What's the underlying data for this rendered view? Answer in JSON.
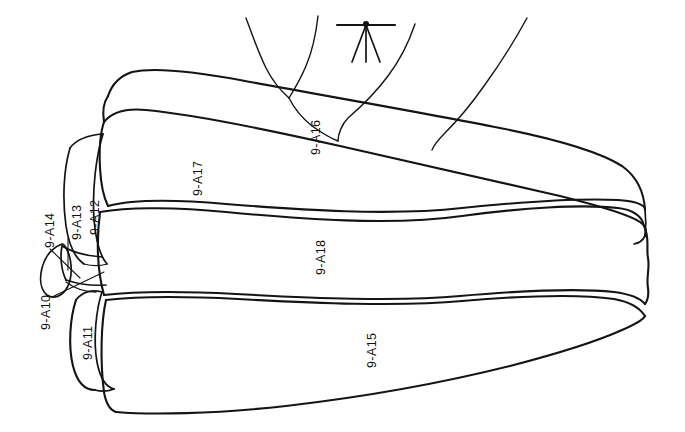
{
  "figure": {
    "background_color": "#ffffff",
    "line_color": "#141414",
    "canvas": {
      "width": 685,
      "height": 432
    }
  },
  "labels": [
    {
      "id": "9-A10",
      "text": "9-A10",
      "x": 40,
      "y": 330,
      "has_leader": true
    },
    {
      "id": "9-A11",
      "text": "9-A11",
      "x": 82,
      "y": 360,
      "has_leader": false
    },
    {
      "id": "9-A12",
      "text": "9-A12",
      "x": 89,
      "y": 235,
      "has_leader": false
    },
    {
      "id": "9-A13",
      "text": "9-A13",
      "x": 71,
      "y": 240,
      "has_leader": true
    },
    {
      "id": "9-A14",
      "text": "9-A14",
      "x": 44,
      "y": 248,
      "has_leader": true
    },
    {
      "id": "9-A15",
      "text": "9-A15",
      "x": 366,
      "y": 368,
      "has_leader": false
    },
    {
      "id": "9-A16",
      "text": "9-A16",
      "x": 310,
      "y": 155,
      "has_leader": false
    },
    {
      "id": "9-A17",
      "text": "9-A17",
      "x": 192,
      "y": 196,
      "has_leader": false
    },
    {
      "id": "9-A18",
      "text": "9-A18",
      "x": 315,
      "y": 275,
      "has_leader": false
    }
  ],
  "marker": {
    "name": "tripod-arrow-marker",
    "description": "small arrow with horizontal crossbar at top of figure"
  }
}
